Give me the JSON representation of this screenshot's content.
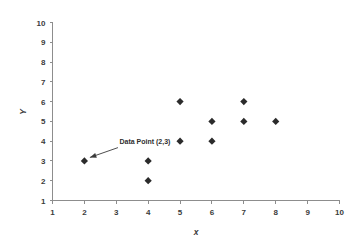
{
  "chart_data": {
    "type": "scatter",
    "title": "",
    "xlabel": "x",
    "ylabel": "Y",
    "xlim": [
      1,
      10
    ],
    "ylim": [
      1,
      10
    ],
    "grid": false,
    "legend": false,
    "x_ticks": [
      "1",
      "2",
      "3",
      "4",
      "5",
      "6",
      "7",
      "8",
      "9",
      "10"
    ],
    "y_ticks": [
      "1",
      "2",
      "3",
      "4",
      "5",
      "6",
      "7",
      "8",
      "9",
      "10"
    ],
    "marker_style": "diamond",
    "marker_color": "#2b2b2b",
    "points": [
      {
        "x": 2,
        "y": 3
      },
      {
        "x": 4,
        "y": 3
      },
      {
        "x": 4,
        "y": 2
      },
      {
        "x": 5,
        "y": 6
      },
      {
        "x": 5,
        "y": 4
      },
      {
        "x": 6,
        "y": 5
      },
      {
        "x": 6,
        "y": 4
      },
      {
        "x": 7,
        "y": 6
      },
      {
        "x": 7,
        "y": 5
      },
      {
        "x": 8,
        "y": 5
      }
    ],
    "annotations": [
      {
        "text": "Data Point (2,3)",
        "target_x": 2,
        "target_y": 3,
        "label_x": 3.1,
        "label_y": 3.75
      }
    ]
  },
  "axis": {
    "x_title": "x",
    "y_title": "Y"
  },
  "colors": {
    "background": "#ffffff",
    "axis": "#8d8d8d",
    "marker": "#2b2b2b",
    "text": "#3b3b3b",
    "annotation": "#2f2f2f"
  }
}
